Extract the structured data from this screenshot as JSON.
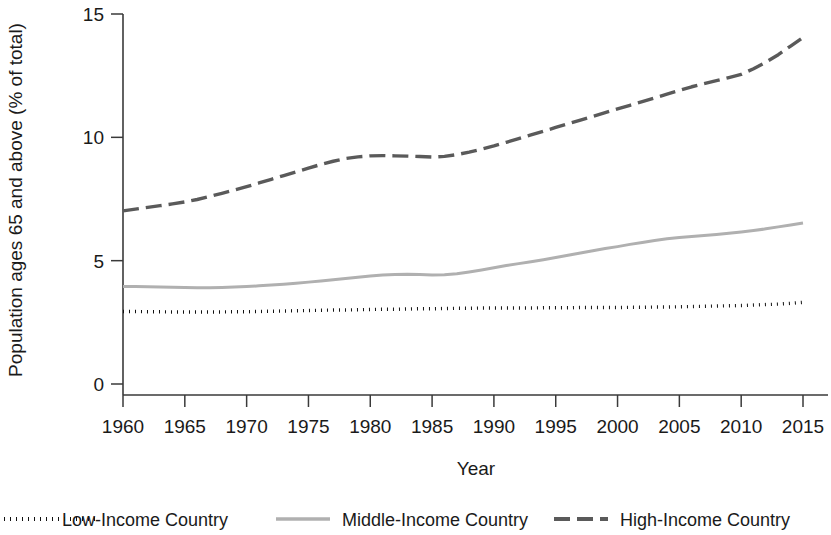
{
  "chart_data": {
    "type": "line",
    "title": "",
    "subtitle": "",
    "xlabel": "Year",
    "ylabel": "Population ages 65 and above (% of total)",
    "xlim": [
      1960,
      2015
    ],
    "ylim": [
      0,
      15
    ],
    "xticks": [
      1960,
      1965,
      1970,
      1975,
      1980,
      1985,
      1990,
      1995,
      2000,
      2005,
      2010,
      2015
    ],
    "xticklabels": [
      "1960",
      "1965",
      "1970",
      "1975",
      "1980",
      "1985",
      "1990",
      "1995",
      "2000",
      "2005",
      "2010",
      "2015"
    ],
    "yticks": [
      0,
      5,
      10,
      15
    ],
    "yticklabels": [
      "0",
      "5",
      "10",
      "15"
    ],
    "grid": false,
    "legend_position": "bottom",
    "x": [
      1960,
      1961,
      1962,
      1963,
      1964,
      1965,
      1966,
      1967,
      1968,
      1969,
      1970,
      1971,
      1972,
      1973,
      1974,
      1975,
      1976,
      1977,
      1978,
      1979,
      1980,
      1981,
      1982,
      1983,
      1984,
      1985,
      1986,
      1987,
      1988,
      1989,
      1990,
      1991,
      1992,
      1993,
      1994,
      1995,
      1996,
      1997,
      1998,
      1999,
      2000,
      2001,
      2002,
      2003,
      2004,
      2005,
      2006,
      2007,
      2008,
      2009,
      2010,
      2011,
      2012,
      2013,
      2014,
      2015
    ],
    "series": [
      {
        "name": "Low-Income Country",
        "style": "dotted",
        "color": "#111111",
        "width": 3.4,
        "dasharray": "1 5",
        "values": [
          2.94,
          2.94,
          2.93,
          2.93,
          2.92,
          2.92,
          2.92,
          2.92,
          2.92,
          2.93,
          2.93,
          2.94,
          2.95,
          2.96,
          2.97,
          2.98,
          2.99,
          3.0,
          3.0,
          3.01,
          3.02,
          3.03,
          3.03,
          3.04,
          3.05,
          3.05,
          3.06,
          3.07,
          3.07,
          3.08,
          3.08,
          3.08,
          3.08,
          3.08,
          3.09,
          3.09,
          3.09,
          3.1,
          3.1,
          3.1,
          3.1,
          3.11,
          3.11,
          3.12,
          3.12,
          3.13,
          3.14,
          3.15,
          3.16,
          3.17,
          3.18,
          3.2,
          3.22,
          3.24,
          3.27,
          3.31
        ]
      },
      {
        "name": "Middle-Income Country",
        "style": "solid",
        "color": "#b0b0b0",
        "width": 3.0,
        "dasharray": "none",
        "values": [
          3.95,
          3.95,
          3.94,
          3.93,
          3.92,
          3.91,
          3.9,
          3.9,
          3.91,
          3.93,
          3.95,
          3.98,
          4.01,
          4.04,
          4.08,
          4.13,
          4.18,
          4.23,
          4.28,
          4.33,
          4.38,
          4.42,
          4.44,
          4.45,
          4.44,
          4.42,
          4.43,
          4.47,
          4.54,
          4.62,
          4.71,
          4.8,
          4.88,
          4.96,
          5.04,
          5.13,
          5.22,
          5.31,
          5.4,
          5.49,
          5.57,
          5.66,
          5.74,
          5.82,
          5.89,
          5.94,
          5.98,
          6.02,
          6.06,
          6.11,
          6.16,
          6.22,
          6.29,
          6.37,
          6.45,
          6.53
        ]
      },
      {
        "name": "High-Income Country",
        "style": "dashed",
        "color": "#5a5a5a",
        "width": 3.4,
        "dasharray": "16 7",
        "values": [
          7.02,
          7.09,
          7.16,
          7.23,
          7.3,
          7.38,
          7.48,
          7.6,
          7.73,
          7.86,
          8.0,
          8.15,
          8.3,
          8.45,
          8.6,
          8.75,
          8.9,
          9.03,
          9.14,
          9.21,
          9.25,
          9.26,
          9.25,
          9.24,
          9.22,
          9.2,
          9.23,
          9.3,
          9.4,
          9.52,
          9.65,
          9.8,
          9.95,
          10.1,
          10.25,
          10.4,
          10.55,
          10.7,
          10.85,
          11.0,
          11.15,
          11.3,
          11.45,
          11.6,
          11.75,
          11.9,
          12.05,
          12.18,
          12.3,
          12.42,
          12.55,
          12.78,
          13.05,
          13.35,
          13.7,
          14.05
        ]
      }
    ]
  },
  "legend": {
    "items": [
      {
        "label": "Low-Income Country"
      },
      {
        "label": "Middle-Income Country"
      },
      {
        "label": "High-Income Country"
      }
    ]
  }
}
